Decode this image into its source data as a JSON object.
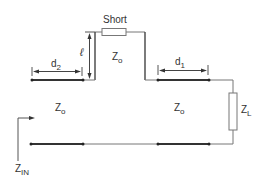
{
  "diagram": {
    "labels": {
      "short": "Short",
      "stub_length": "ℓ",
      "d2_main": "d",
      "d2_sub": "2",
      "d1_main": "d",
      "d1_sub": "1",
      "z0_main": "Z",
      "z0_sub": "o",
      "zl_main": "Z",
      "zl_sub": "L",
      "zin_main": "Z",
      "zin_sub": "IN"
    },
    "colors": {
      "line": "#333333",
      "thin_line": "#777777",
      "text": "#333333",
      "background": "#ffffff"
    }
  }
}
